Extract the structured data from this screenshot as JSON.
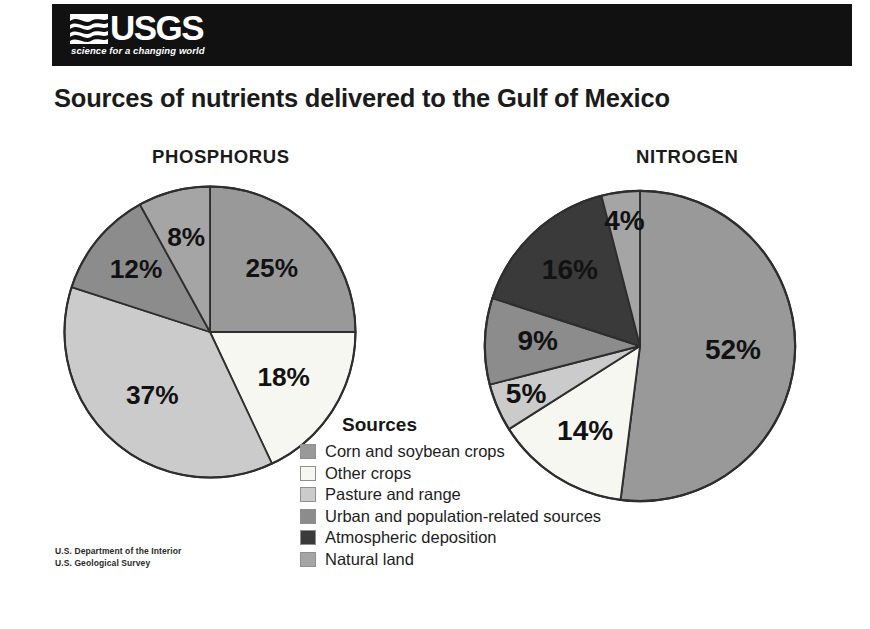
{
  "header": {
    "logo_text": "USGS",
    "tagline": "science for a changing world",
    "wave_icon": "usgs-wave-icon",
    "band_color": "#111111"
  },
  "title": "Sources of nutrients delivered to the Gulf of Mexico",
  "footer": {
    "line1": "U.S. Department of the Interior",
    "line2": "U.S. Geological Survey"
  },
  "legend": {
    "title": "Sources",
    "items": [
      {
        "label": "Corn and soybean crops",
        "color": "#999999"
      },
      {
        "label": "Other crops",
        "color": "#f7f7f2"
      },
      {
        "label": "Pasture and range",
        "color": "#cbcbcb"
      },
      {
        "label": "Urban and population-related sources",
        "color": "#8c8c8c"
      },
      {
        "label": "Atmospheric deposition",
        "color": "#3a3a3a"
      },
      {
        "label": "Natural land",
        "color": "#a5a5a5"
      }
    ]
  },
  "chart_data": [
    {
      "type": "pie",
      "title": "PHOSPHORUS",
      "categories": [
        "Corn and soybean crops",
        "Other crops",
        "Pasture and range",
        "Urban and population-related sources",
        "Natural land"
      ],
      "values": [
        25,
        18,
        37,
        12,
        8
      ],
      "labels": [
        "25%",
        "18%",
        "37%",
        "12%",
        "8%"
      ],
      "colors": [
        "#999999",
        "#f7f7f2",
        "#cbcbcb",
        "#8c8c8c",
        "#a5a5a5"
      ],
      "start_angle_deg": 0,
      "direction": "clockwise",
      "legend_position": "center-bottom",
      "units": "percent"
    },
    {
      "type": "pie",
      "title": "NITROGEN",
      "categories": [
        "Corn and soybean crops",
        "Other crops",
        "Pasture and range",
        "Urban and population-related sources",
        "Atmospheric deposition",
        "Natural land"
      ],
      "values": [
        52,
        14,
        5,
        9,
        16,
        4
      ],
      "labels": [
        "52%",
        "14%",
        "5%",
        "9%",
        "16%",
        "4%"
      ],
      "colors": [
        "#999999",
        "#f7f7f2",
        "#cbcbcb",
        "#8c8c8c",
        "#3a3a3a",
        "#a5a5a5"
      ],
      "start_angle_deg": 0,
      "direction": "clockwise",
      "legend_position": "center-bottom",
      "units": "percent"
    }
  ]
}
